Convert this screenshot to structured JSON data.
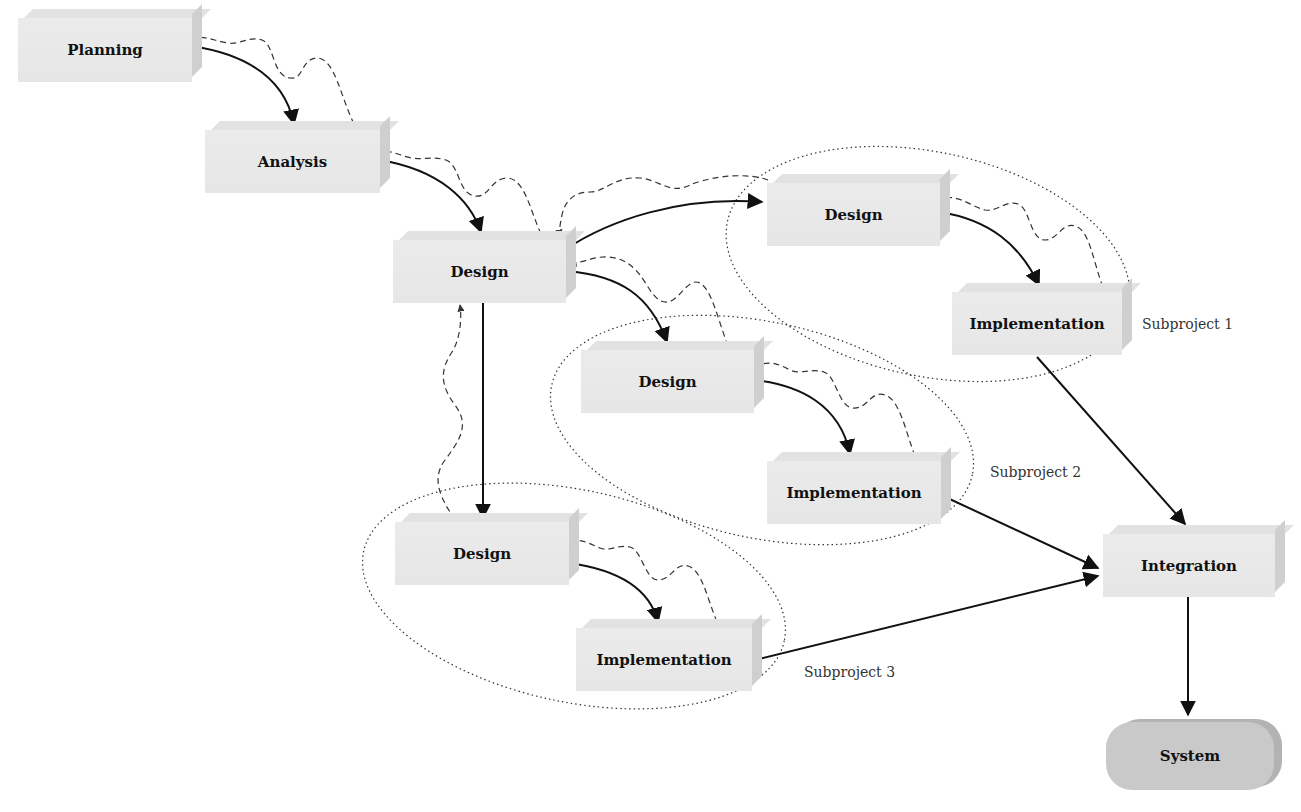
{
  "diagram": {
    "title": "",
    "nodes": [
      {
        "id": "planning",
        "label": "Planning",
        "type": "box"
      },
      {
        "id": "analysis",
        "label": "Analysis",
        "type": "box"
      },
      {
        "id": "design_main",
        "label": "Design",
        "type": "box"
      },
      {
        "id": "design_sp1",
        "label": "Design",
        "type": "box",
        "group": "subproject1"
      },
      {
        "id": "impl_sp1",
        "label": "Implementation",
        "type": "box",
        "group": "subproject1"
      },
      {
        "id": "design_sp2",
        "label": "Design",
        "type": "box",
        "group": "subproject2"
      },
      {
        "id": "impl_sp2",
        "label": "Implementation",
        "type": "box",
        "group": "subproject2"
      },
      {
        "id": "design_sp3",
        "label": "Design",
        "type": "box",
        "group": "subproject3"
      },
      {
        "id": "impl_sp3",
        "label": "Implementation",
        "type": "box",
        "group": "subproject3"
      },
      {
        "id": "integration",
        "label": "Integration",
        "type": "box"
      },
      {
        "id": "system",
        "label": "System",
        "type": "terminal"
      }
    ],
    "groups": [
      {
        "id": "subproject1",
        "label": "Subproject 1"
      },
      {
        "id": "subproject2",
        "label": "Subproject 2"
      },
      {
        "id": "subproject3",
        "label": "Subproject 3"
      }
    ],
    "edges_forward": [
      {
        "from": "planning",
        "to": "analysis",
        "style": "solid"
      },
      {
        "from": "analysis",
        "to": "design_main",
        "style": "solid"
      },
      {
        "from": "design_main",
        "to": "design_sp1",
        "style": "solid"
      },
      {
        "from": "design_main",
        "to": "design_sp2",
        "style": "solid"
      },
      {
        "from": "design_main",
        "to": "design_sp3",
        "style": "solid"
      },
      {
        "from": "design_sp1",
        "to": "impl_sp1",
        "style": "solid"
      },
      {
        "from": "design_sp2",
        "to": "impl_sp2",
        "style": "solid"
      },
      {
        "from": "design_sp3",
        "to": "impl_sp3",
        "style": "solid"
      },
      {
        "from": "impl_sp1",
        "to": "integration",
        "style": "solid"
      },
      {
        "from": "impl_sp2",
        "to": "integration",
        "style": "solid"
      },
      {
        "from": "impl_sp3",
        "to": "integration",
        "style": "solid"
      },
      {
        "from": "integration",
        "to": "system",
        "style": "solid"
      }
    ],
    "edges_feedback": [
      {
        "from": "analysis",
        "to": "planning",
        "style": "dashed-wavy"
      },
      {
        "from": "design_main",
        "to": "analysis",
        "style": "dashed-wavy"
      },
      {
        "from": "design_sp1",
        "to": "design_main",
        "style": "dashed-wavy"
      },
      {
        "from": "design_sp2",
        "to": "design_main",
        "style": "dashed-wavy"
      },
      {
        "from": "design_sp3",
        "to": "design_main",
        "style": "dashed-wavy"
      },
      {
        "from": "impl_sp1",
        "to": "design_sp1",
        "style": "dashed-wavy"
      },
      {
        "from": "impl_sp2",
        "to": "design_sp2",
        "style": "dashed-wavy"
      },
      {
        "from": "impl_sp3",
        "to": "design_sp3",
        "style": "dashed-wavy"
      }
    ],
    "colors": {
      "box_face": "#e8e8e8",
      "box_side": "#cfcfcf",
      "terminal_fill": "#c9c9c9",
      "line": "#111111",
      "dashed_line": "#444444"
    }
  }
}
